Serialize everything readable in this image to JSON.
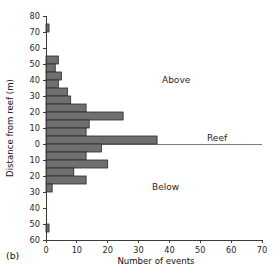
{
  "figure": {
    "panel_label": "(b)",
    "background": "#ffffff",
    "bar_fill": "#706f6f",
    "bar_edge": "#2b2b2b",
    "axis_color": "#3a3a3a",
    "reef_line_color": "#7d7d7d"
  },
  "annotations": {
    "above": "Above",
    "reef": "Reef",
    "below": "Below"
  },
  "chart_data": {
    "type": "bar",
    "orientation": "horizontal",
    "title": "",
    "subtitle": "",
    "xlabel": "Number of events",
    "ylabel": "Distance from reef (m)",
    "xlim": [
      0,
      70
    ],
    "ylim": [
      -60,
      80
    ],
    "xticks": [
      0,
      10,
      20,
      30,
      40,
      50,
      60,
      70
    ],
    "xtick_labels": [
      "0",
      "10",
      "20",
      "30",
      "40",
      "50",
      "60",
      "70"
    ],
    "yticks": [
      80,
      70,
      60,
      50,
      40,
      30,
      20,
      10,
      0,
      -10,
      -20,
      -30,
      -40,
      -50,
      -60
    ],
    "ytick_labels": [
      "80",
      "70",
      "60",
      "50",
      "40",
      "30",
      "20",
      "10",
      "0",
      "10",
      "20",
      "30",
      "40",
      "50",
      "60"
    ],
    "grid": false,
    "legend": false,
    "bin_width": 5,
    "categories": [
      "75 to 80",
      "70 to 75",
      "65 to 70",
      "60 to 65",
      "55 to 60",
      "50 to 55",
      "45 to 50",
      "40 to 45",
      "35 to 40",
      "30 to 35",
      "25 to 30",
      "20 to 25",
      "15 to 20",
      "10 to 15",
      "5 to 10",
      "0 to 5",
      "-5 to 0",
      "-10 to -5",
      "-15 to -10",
      "-20 to -15",
      "-25 to -20",
      "-30 to -25",
      "-35 to -30",
      "-40 to -35",
      "-45 to -40",
      "-50 to -45",
      "-55 to -50",
      "-60 to -55"
    ],
    "bin_lower": [
      75,
      70,
      65,
      60,
      55,
      50,
      45,
      40,
      35,
      30,
      25,
      20,
      15,
      10,
      5,
      0,
      -5,
      -10,
      -15,
      -20,
      -25,
      -30,
      -35,
      -40,
      -45,
      -50,
      -55,
      -60
    ],
    "bin_upper": [
      80,
      75,
      70,
      65,
      60,
      55,
      50,
      45,
      40,
      35,
      30,
      25,
      20,
      15,
      10,
      5,
      0,
      -5,
      -10,
      -15,
      -20,
      -25,
      -30,
      -35,
      -40,
      -45,
      -50,
      -55
    ],
    "values": [
      0,
      1,
      0,
      0,
      0,
      4,
      3,
      5,
      4,
      7,
      8,
      13,
      25,
      14,
      13,
      36,
      18,
      13,
      20,
      9,
      13,
      2,
      0,
      0,
      0,
      0,
      1,
      0
    ],
    "series": [
      {
        "name": "Number of events",
        "values": [
          0,
          1,
          0,
          0,
          0,
          4,
          3,
          5,
          4,
          7,
          8,
          13,
          25,
          14,
          13,
          36,
          18,
          13,
          20,
          9,
          13,
          2,
          0,
          0,
          0,
          0,
          1,
          0
        ]
      }
    ],
    "reef_level": 0,
    "max_value": 36
  }
}
